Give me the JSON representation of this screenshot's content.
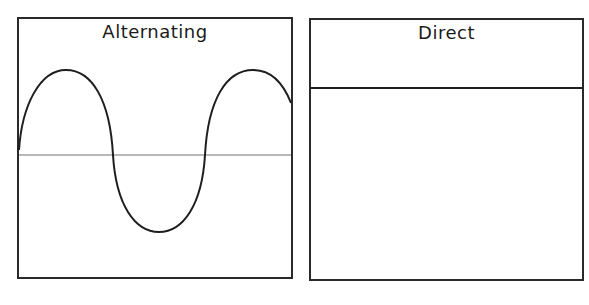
{
  "panels": [
    {
      "title": "Alternating",
      "waveform": "sine",
      "axis_color": "#b0b0b0",
      "line_color": "#222222"
    },
    {
      "title": "Direct",
      "waveform": "constant",
      "line_color": "#222222"
    }
  ]
}
